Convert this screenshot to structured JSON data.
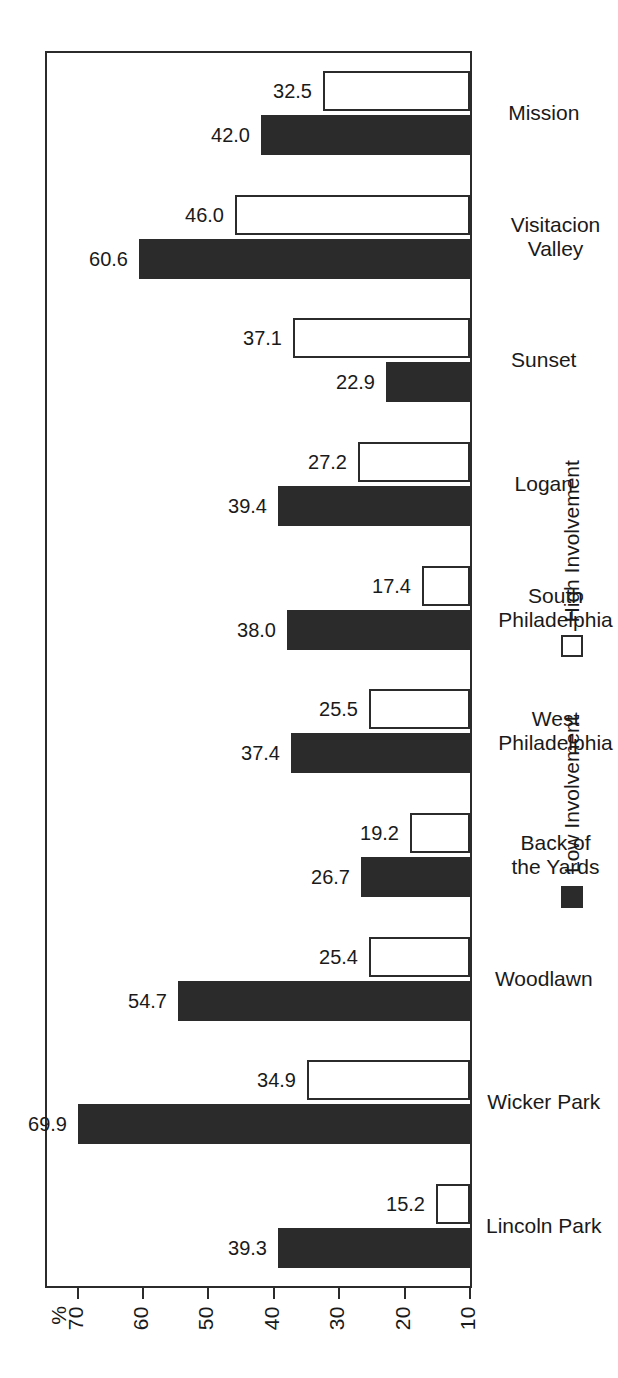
{
  "chart_data": {
    "type": "bar",
    "title": "",
    "xlabel": "",
    "ylabel": "%",
    "ylim": [
      10,
      75
    ],
    "axis_ticks": [
      70,
      60,
      50,
      40,
      30,
      20,
      10
    ],
    "axis_unit": "%",
    "baseline": 10,
    "grid": false,
    "orientation": "horizontal-rotated",
    "legend_position": "bottom",
    "categories": [
      "Lincoln Park",
      "Wicker Park",
      "Woodlawn",
      "Back of\nthe Yards",
      "West\nPhiladelphia",
      "South\nPhiladelphia",
      "Logan",
      "Sunset",
      "Visitacion\nValley",
      "Mission"
    ],
    "series": [
      {
        "name": "Low Involvement",
        "color": "#2b2b2b",
        "values": [
          39.3,
          69.9,
          54.7,
          26.7,
          37.4,
          38.0,
          39.4,
          22.9,
          60.6,
          42.0
        ],
        "labels": [
          "39.3",
          "69.9",
          "54.7",
          "26.7",
          "37.4",
          "38.0",
          "39.4",
          "22.9",
          "60.6",
          "42.0"
        ]
      },
      {
        "name": "High Involvement",
        "color": "#ffffff",
        "values": [
          15.2,
          34.9,
          25.4,
          19.2,
          25.5,
          17.4,
          27.2,
          37.1,
          46.0,
          32.5
        ],
        "labels": [
          "15.2",
          "34.9",
          "25.4",
          "19.2",
          "25.5",
          "17.4",
          "27.2",
          "37.1",
          "46.0",
          "32.5"
        ]
      }
    ]
  },
  "legend": {
    "items": [
      {
        "label": "Low Involvement",
        "swatch": "filled-square-icon"
      },
      {
        "label": "High Involvement",
        "swatch": "open-square-icon"
      }
    ]
  }
}
